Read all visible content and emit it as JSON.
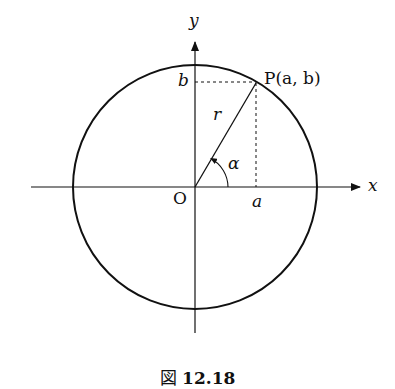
{
  "figure": {
    "labels": {
      "y_axis": "y",
      "x_axis": "x",
      "origin": "O",
      "point": "P(a, b)",
      "b": "b",
      "a": "a",
      "radius": "r",
      "angle": "α"
    },
    "caption": {
      "prefix": "図",
      "number": "12.18"
    }
  }
}
